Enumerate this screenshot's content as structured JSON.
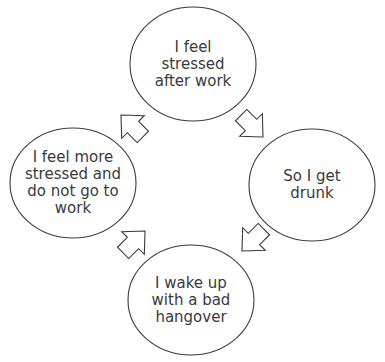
{
  "diagram": {
    "type": "cycle",
    "stroke_color": "#3a3a3a",
    "text_color": "#3a3a3a",
    "background": "#ffffff",
    "nodes": [
      {
        "id": "top",
        "label": "I feel\nstressed\nafter work"
      },
      {
        "id": "right",
        "label": "So I get\ndrunk"
      },
      {
        "id": "bottom",
        "label": "I wake up\nwith a bad\nhangover"
      },
      {
        "id": "left",
        "label": "I feel more\nstressed and\ndo not go to\nwork"
      }
    ],
    "edges": [
      {
        "from": "top",
        "to": "right",
        "icon": "block-arrow-down-right"
      },
      {
        "from": "right",
        "to": "bottom",
        "icon": "block-arrow-down-left"
      },
      {
        "from": "bottom",
        "to": "left",
        "icon": "block-arrow-up-left"
      },
      {
        "from": "left",
        "to": "top",
        "icon": "block-arrow-up-right"
      }
    ]
  }
}
